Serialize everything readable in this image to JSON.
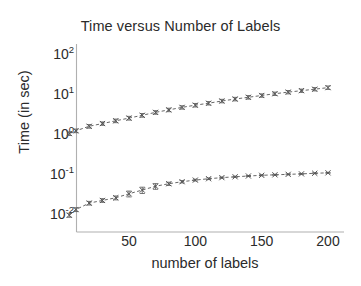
{
  "chart_data": {
    "type": "line",
    "title": "Time versus Number of Labels",
    "xlabel": "number of labels",
    "ylabel": "Time (in sec)",
    "xscale": "linear",
    "yscale": "log",
    "xlim": [
      2,
      205
    ],
    "ylim": [
      0.006,
      100
    ],
    "grid": false,
    "legend": "none",
    "marker": "x",
    "linestyle": "dashed",
    "errorbars": true,
    "xticks": [
      50,
      100,
      150,
      200
    ],
    "xticklabels": [
      "50",
      "100",
      "150",
      "200"
    ],
    "yticks": [
      100,
      10,
      1,
      0.1,
      0.01
    ],
    "yticklabels": [
      "10",
      "10",
      "10",
      "10",
      "10"
    ],
    "ytickexponents": [
      "2",
      "1",
      "0",
      "-1",
      "-2"
    ],
    "x": [
      5,
      10,
      20,
      30,
      40,
      50,
      60,
      70,
      80,
      90,
      100,
      110,
      120,
      130,
      140,
      150,
      160,
      170,
      180,
      190,
      200
    ],
    "series": [
      {
        "name": "upper-curve",
        "color": "#555555",
        "values": [
          1.15,
          1.35,
          1.75,
          2.05,
          2.4,
          2.8,
          3.3,
          3.9,
          4.5,
          5.2,
          5.9,
          6.6,
          7.5,
          8.4,
          9.3,
          10.3,
          11.4,
          12.5,
          13.6,
          14.8,
          16.2
        ],
        "errors": [
          0.12,
          0.14,
          0.18,
          0.2,
          0.25,
          0.3,
          0.35,
          0.4,
          0.45,
          0.5,
          0.6,
          0.65,
          0.75,
          0.85,
          0.95,
          1.0,
          1.1,
          1.2,
          1.3,
          1.4,
          1.6
        ]
      },
      {
        "name": "lower-curve",
        "color": "#555555",
        "values": [
          0.0105,
          0.0145,
          0.021,
          0.0245,
          0.0285,
          0.036,
          0.0445,
          0.0555,
          0.064,
          0.072,
          0.079,
          0.0855,
          0.091,
          0.0955,
          0.1,
          0.104,
          0.107,
          0.11,
          0.113,
          0.117,
          0.12
        ],
        "errors": [
          0.0012,
          0.0016,
          0.0022,
          0.0026,
          0.0032,
          0.006,
          0.008,
          0.009,
          0.006,
          0.005,
          0.004,
          0.004,
          0.003,
          0.003,
          0.003,
          0.003,
          0.003,
          0.003,
          0.003,
          0.003,
          0.003
        ]
      }
    ]
  },
  "axes": {
    "frame_color": "#b0b0b0",
    "tick_color": "#555555"
  }
}
